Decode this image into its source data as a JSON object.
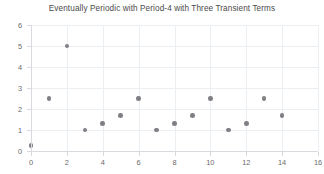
{
  "chart": {
    "title": "Eventually Periodic with Period-4 with Three Transient Terms"
  },
  "chart_data": {
    "type": "scatter",
    "title": "Eventually Periodic with Period-4 with Three Transient Terms",
    "xlabel": "",
    "ylabel": "",
    "xlim": [
      0,
      16
    ],
    "ylim": [
      0,
      6
    ],
    "grid": true,
    "legend": false,
    "marker_color": "#7f7f85",
    "x": [
      0,
      1,
      2,
      3,
      4,
      5,
      6,
      7,
      8,
      9,
      10,
      11,
      12,
      13,
      14
    ],
    "y": [
      0.25,
      2.5,
      5,
      1,
      1.3,
      1.7,
      2.5,
      1,
      1.3,
      1.7,
      2.5,
      1,
      1.3,
      2.5,
      1.7
    ],
    "x_ticks": [
      0,
      2,
      4,
      6,
      8,
      10,
      12,
      14,
      16
    ],
    "x_tick_labels": [
      "0",
      "2",
      "4",
      "6",
      "8",
      "10",
      "12",
      "14",
      "16"
    ],
    "y_ticks": [
      0,
      1,
      2,
      3,
      4,
      5,
      6
    ],
    "y_tick_labels": [
      "0",
      "1",
      "2",
      "3",
      "4",
      "5",
      "6"
    ],
    "y_gridlines": [
      1,
      2,
      3,
      4,
      5,
      6
    ],
    "x_gridlines": [
      2,
      4,
      6,
      8,
      10,
      12,
      14,
      16
    ]
  }
}
